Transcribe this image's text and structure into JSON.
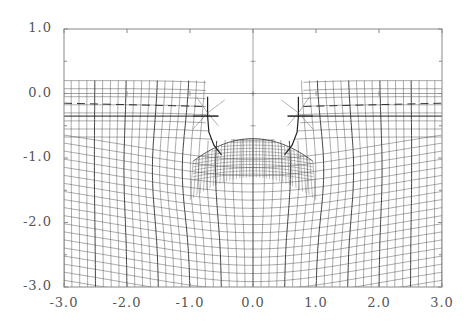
{
  "chart_data": {
    "type": "line",
    "title": "",
    "xlabel": "",
    "ylabel": "",
    "xlim": [
      -3.0,
      3.0
    ],
    "ylim": [
      -3.0,
      1.0
    ],
    "x_ticks": [
      "-3.0",
      "-2.0",
      "-1.0",
      "0.0",
      "1.0",
      "2.0",
      "3.0"
    ],
    "y_ticks": [
      "1.0",
      "0.0",
      "-1.0",
      "-2.0",
      "-3.0"
    ],
    "x_tick_values": [
      -3.0,
      -2.0,
      -1.0,
      0.0,
      1.0,
      2.0,
      3.0
    ],
    "y_tick_values": [
      1.0,
      0.0,
      -1.0,
      -2.0,
      -3.0
    ],
    "grid": false,
    "legend": null,
    "annotations": {
      "dense_cap_top_y": -0.7,
      "dense_cap_half_width": 0.95,
      "cusp_points": [
        [
          -0.7,
          -0.3
        ],
        [
          0.7,
          -0.3
        ]
      ],
      "dashed_line_y": -0.15,
      "mesh_top_y": 0.2
    },
    "line_color": "#333333",
    "frame_color": "#888888"
  },
  "frame": {
    "left": 64,
    "top": 29,
    "right": 442,
    "bottom": 287
  }
}
